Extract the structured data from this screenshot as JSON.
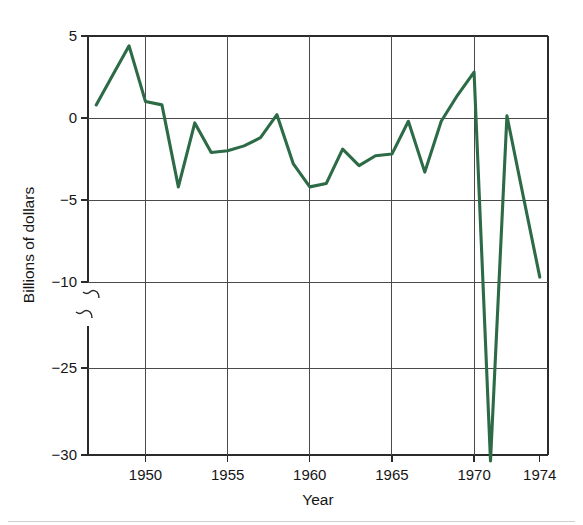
{
  "chart_data": {
    "type": "line",
    "title": "",
    "xlabel": "Year",
    "ylabel": "Billions of dollars",
    "xlim": [
      1946.5,
      1974.5
    ],
    "ylim": [
      -30,
      5
    ],
    "grid": true,
    "legend": null,
    "line_color": "#2d6b47",
    "axis_color": "#2b2b2b",
    "background_color": "#ffffff",
    "y_axis_broken": true,
    "y_break_between": [
      -10,
      -25
    ],
    "y_ticks": [
      5,
      0,
      -5,
      -10,
      -25,
      -30
    ],
    "y_tick_labels": [
      "5",
      "0",
      "−5",
      "−10",
      "−25",
      "−30"
    ],
    "x_ticks": [
      1950,
      1955,
      1960,
      1965,
      1970,
      1974
    ],
    "x_tick_labels": [
      "1950",
      "1955",
      "1960",
      "1965",
      "1970",
      "1974"
    ],
    "x_gridlines": [
      1950,
      1955,
      1960,
      1965,
      1970
    ],
    "y_gridlines": [
      0,
      -5,
      -10,
      -25
    ],
    "x": [
      1947,
      1948,
      1949,
      1950,
      1951,
      1952,
      1953,
      1954,
      1955,
      1956,
      1957,
      1958,
      1959,
      1960,
      1961,
      1962,
      1963,
      1964,
      1965,
      1966,
      1967,
      1968,
      1969,
      1970,
      1971,
      1972,
      1973,
      1974
    ],
    "values": [
      0.8,
      2.6,
      4.4,
      1.0,
      0.8,
      -4.2,
      -0.3,
      -2.1,
      -2.0,
      -1.7,
      -1.2,
      0.2,
      -2.8,
      -4.2,
      -4.0,
      -1.9,
      -2.9,
      -2.3,
      -2.2,
      -0.2,
      -3.3,
      -0.2,
      1.4,
      2.8,
      -30.5,
      -10.5,
      -4.8,
      -9.7
    ],
    "series": [
      {
        "name": "Surplus or deficit",
        "color": "#2d6b47",
        "values": [
          0.8,
          2.6,
          4.4,
          1.0,
          0.8,
          -4.2,
          -0.3,
          -2.1,
          -2.0,
          -1.7,
          -1.2,
          0.2,
          -2.8,
          -4.2,
          -4.0,
          -1.9,
          -2.9,
          -2.3,
          -2.2,
          -0.2,
          -3.3,
          -0.2,
          1.4,
          2.8,
          -30.5,
          -10.5,
          -4.8,
          -9.7
        ]
      }
    ],
    "annotations": [
      {
        "name": "axis-break-squiggle",
        "position": "y-axis between -10 and -25"
      },
      {
        "name": "offscale-plunge",
        "position": "line drops below -30 near 1971-1972"
      }
    ]
  },
  "figure": {
    "y_axis_title": "Billions of dollars",
    "x_axis_title": "Year"
  }
}
